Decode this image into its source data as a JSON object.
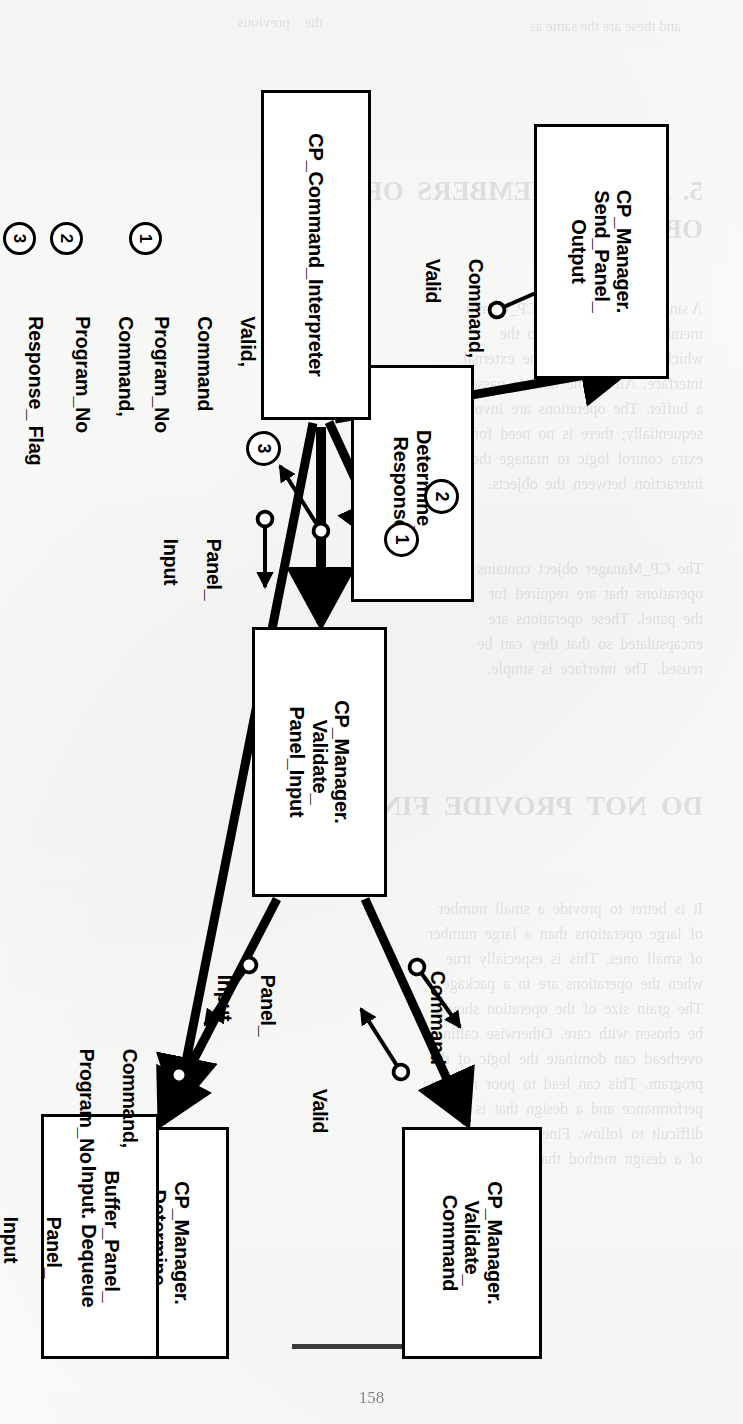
{
  "figure": {
    "type": "structure-chart",
    "orientation": "rotated-90-clockwise-on-page",
    "boxes": [
      {
        "id": "send_panel_output",
        "lines": [
          "CP_Manager.",
          "Send_Panel_",
          "Output"
        ]
      },
      {
        "id": "determine_response",
        "lines": [
          "Determine_",
          "Response"
        ]
      },
      {
        "id": "command_interpreter",
        "lines": [
          "CP_Command_Interpreter"
        ]
      },
      {
        "id": "validate_panel_input",
        "lines": [
          "CP_Manager.",
          "Validate_",
          "Panel_Input"
        ]
      },
      {
        "id": "validate_command",
        "lines": [
          "CP_Manager.",
          "Validate_",
          "Command"
        ]
      },
      {
        "id": "determine_command",
        "lines": [
          "CP_Manager.",
          "Determine_",
          "Command"
        ]
      },
      {
        "id": "buffer_panel_input_dequeue",
        "lines": [
          "Buffer_Panel_",
          "Input. Dequeue"
        ]
      }
    ],
    "flow_labels": [
      {
        "id": "f_command_valid",
        "lines": [
          "Command,",
          "Valid"
        ]
      },
      {
        "id": "f_command",
        "lines": [
          "Command"
        ]
      },
      {
        "id": "f_valid",
        "lines": [
          "Valid"
        ]
      },
      {
        "id": "f_panel_input_left",
        "lines": [
          "Panel_",
          "Input"
        ]
      },
      {
        "id": "f_panel_input_right",
        "lines": [
          "Panel_",
          "Input"
        ]
      },
      {
        "id": "f_command_program_no",
        "lines": [
          "Command,",
          "Program_No"
        ]
      },
      {
        "id": "f_panel_input_bottom",
        "lines": [
          "Panel_",
          "Input"
        ]
      }
    ],
    "callouts": [
      {
        "id": "callout-1",
        "number": "1"
      },
      {
        "id": "callout-2",
        "number": "2"
      },
      {
        "id": "callout-3",
        "number": "3"
      }
    ],
    "legend": [
      {
        "number": "1",
        "lines": [
          "Valid,",
          "Command",
          "Program_No"
        ]
      },
      {
        "number": "2",
        "lines": [
          "Command,",
          "Program_No"
        ]
      },
      {
        "number": "3",
        "lines": [
          "Response_ Flag"
        ]
      }
    ]
  },
  "page": {
    "number": "158",
    "bleed_through": [
      {
        "x": 62,
        "y": 18,
        "size": 15,
        "text": "and these are the same as"
      },
      {
        "x": 420,
        "y": 14,
        "size": 15,
        "text": "the    previous"
      },
      {
        "x": 40,
        "y": 176,
        "size": 27,
        "text": "5.  ASSIGN  MEMBERS  OF  THE"
      },
      {
        "x": 40,
        "y": 214,
        "size": 27,
        "text": "OBJECT"
      },
      {
        "x": 40,
        "y": 300,
        "size": 16,
        "text": "A single  member  of  the CP_Comm"
      },
      {
        "x": 40,
        "y": 325,
        "size": 16,
        "text": "member.  It  is  assigned  to  the"
      },
      {
        "x": 40,
        "y": 350,
        "size": 16,
        "text": "which  are  allocated  to  the  external"
      },
      {
        "x": 40,
        "y": 375,
        "size": 16,
        "text": "interface.  All  of  the  data  is  passed"
      },
      {
        "x": 40,
        "y": 400,
        "size": 16,
        "text": "a  buffer.  The  operations  are  invoked"
      },
      {
        "x": 40,
        "y": 425,
        "size": 16,
        "text": "sequentially;  there  is  no  need  for"
      },
      {
        "x": 40,
        "y": 450,
        "size": 16,
        "text": "extra  control  logic  to  manage  the"
      },
      {
        "x": 40,
        "y": 475,
        "size": 16,
        "text": "interaction  between  the  objects."
      },
      {
        "x": 40,
        "y": 560,
        "size": 16,
        "text": "The  CP_Manager  object  contains  the"
      },
      {
        "x": 40,
        "y": 585,
        "size": 16,
        "text": "operations  that  are  required  for"
      },
      {
        "x": 40,
        "y": 610,
        "size": 16,
        "text": "the  panel.  These  operations  are"
      },
      {
        "x": 40,
        "y": 635,
        "size": 16,
        "text": "encapsulated  so  that  they  can  be"
      },
      {
        "x": 40,
        "y": 660,
        "size": 16,
        "text": "reused.  The  interface  is  simple."
      },
      {
        "x": 40,
        "y": 790,
        "size": 28,
        "text": "DO  NOT  PROVIDE  FINE-GRAIN"
      },
      {
        "x": 40,
        "y": 900,
        "size": 16,
        "text": "It  is  better  to  provide  a  small  number"
      },
      {
        "x": 40,
        "y": 925,
        "size": 16,
        "text": "of  large  operations  than  a  large  number"
      },
      {
        "x": 40,
        "y": 950,
        "size": 16,
        "text": "of  small  ones.  This  is  especially  true"
      },
      {
        "x": 40,
        "y": 975,
        "size": 16,
        "text": "when  the  operations  are  in  a  package."
      },
      {
        "x": 40,
        "y": 1000,
        "size": 16,
        "text": "The  grain  size  of  the  operation  should"
      },
      {
        "x": 40,
        "y": 1025,
        "size": 16,
        "text": "be  chosen  with  care.  Otherwise  calling"
      },
      {
        "x": 40,
        "y": 1050,
        "size": 16,
        "text": "overhead  can  dominate  the  logic  of  the"
      },
      {
        "x": 40,
        "y": 1075,
        "size": 16,
        "text": "program.  This  can  lead  to  poor  run-time"
      },
      {
        "x": 40,
        "y": 1100,
        "size": 16,
        "text": "performance  and  a  design  that  is"
      },
      {
        "x": 40,
        "y": 1125,
        "size": 16,
        "text": "difficult  to  follow.  Fineness  is  an  effect"
      },
      {
        "x": 40,
        "y": 1150,
        "size": 16,
        "text": "of  a  design  method  that  decomposes."
      }
    ]
  }
}
